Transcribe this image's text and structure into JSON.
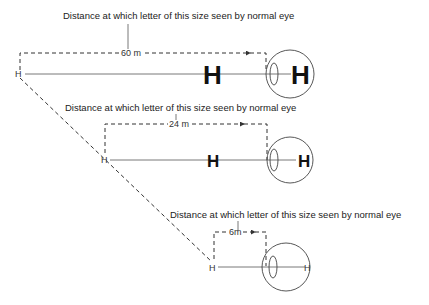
{
  "diagram": {
    "panels": [
      {
        "caption": "Distance at which letter of this size seen by normal eye",
        "distance_label": "60 m",
        "distance_m": 60,
        "letter": "H",
        "object_letter": "H",
        "retina_letter": "H"
      },
      {
        "caption": "Distance at which letter of this size seen by normal eye",
        "distance_label": "24 m",
        "distance_m": 24,
        "letter": "H",
        "object_letter": "H",
        "retina_letter": "H"
      },
      {
        "caption": "Distance at which letter of this size seen by normal eye",
        "distance_label": "6m",
        "distance_m": 6,
        "letter": "H",
        "object_letter": "H",
        "retina_letter": "H"
      }
    ]
  }
}
